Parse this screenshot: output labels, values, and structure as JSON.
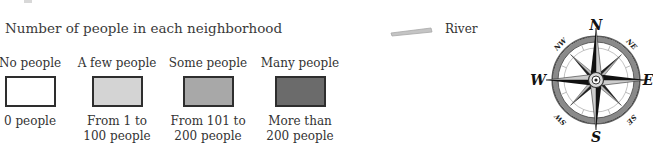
{
  "legend": {
    "title": "Number of people in each neighborhood",
    "categories": [
      {
        "label": "No people",
        "description_line1": "0 people",
        "description_line2": "",
        "fill": "#ffffff"
      },
      {
        "label": "A few people",
        "description_line1": "From 1 to",
        "description_line2": "100 people",
        "fill": "#d4d4d4"
      },
      {
        "label": "Some people",
        "description_line1": "From 101 to",
        "description_line2": "200 people",
        "fill": "#a8a8a8"
      },
      {
        "label": "Many people",
        "description_line1": "More than",
        "description_line2": "200 people",
        "fill": "#6b6b6b"
      }
    ],
    "river": {
      "label": "River",
      "color": "#b8b8b8"
    }
  },
  "compass": {
    "icon": "compass-rose-icon",
    "cardinals": {
      "north": "N",
      "south": "S",
      "east": "E",
      "west": "W"
    },
    "intercardinals": {
      "northwest": "NW",
      "northeast": "NE",
      "southwest": "SW",
      "southeast": "SE"
    }
  }
}
